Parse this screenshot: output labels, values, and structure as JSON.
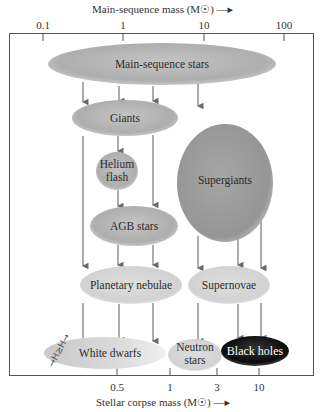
{
  "diagram": {
    "top_axis": {
      "title": "Main-sequence mass (M☉) —▸",
      "ticks": [
        {
          "label": "0.1",
          "x": 43
        },
        {
          "label": "1",
          "x": 123
        },
        {
          "label": "10",
          "x": 204
        },
        {
          "label": "100",
          "x": 284
        }
      ]
    },
    "bottom_axis": {
      "title": "Stellar corpse mass (M☉) —▸",
      "ticks": [
        {
          "label": "0.5",
          "x": 117
        },
        {
          "label": "1",
          "x": 170
        },
        {
          "label": "3",
          "x": 217
        },
        {
          "label": "10",
          "x": 259
        }
      ]
    },
    "nodes": {
      "main_sequence": {
        "label": "Main-sequence stars"
      },
      "giants": {
        "label": "Giants"
      },
      "helium_flash": {
        "line1": "Helium",
        "line2": "flash"
      },
      "agb": {
        "label": "AGB stars"
      },
      "supergiants": {
        "label": "Supergiants"
      },
      "planetary_nebulae": {
        "label": "Planetary nebulae"
      },
      "supernovae": {
        "label": "Supernovae"
      },
      "white_dwarfs": {
        "label": "White dwarfs"
      },
      "neutron_stars": {
        "line1": "Neutron",
        "line2": "stars"
      },
      "black_holes": {
        "label": "Black holes"
      }
    },
    "handwriting": "→H≥H→",
    "colors": {
      "frame": "#555555",
      "arrow": "#6a6a6a",
      "ellipse_mid": "#b4b4b4",
      "ellipse_light": "#dcdcdc",
      "supergiants": "#9a9a9a",
      "black_holes": "#111111"
    }
  }
}
